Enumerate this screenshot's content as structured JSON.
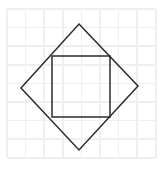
{
  "figure": {
    "background_color": "#ffffff",
    "stroke_color": "#2b2b2b",
    "grid_color": "#efefef",
    "canvas": {
      "width": 161,
      "height": 177
    },
    "grid": {
      "origin_x": 7,
      "origin_y": 9,
      "cell_size": 18.6,
      "columns": 8,
      "rows": 8,
      "visible": true
    },
    "shapes": [
      {
        "name": "rotated-square",
        "type": "polygon",
        "label": "Diamond (square rotated 45 degrees)",
        "points": "79,24 138,86 79,150 21,88"
      },
      {
        "name": "inner-square",
        "type": "polygon",
        "label": "Axis-aligned square",
        "points": "52,56 110,56 110,117 52,117"
      }
    ],
    "vertices": {
      "rotated_square": [
        {
          "name": "top",
          "x": 79,
          "y": 24
        },
        {
          "name": "right",
          "x": 138,
          "y": 86
        },
        {
          "name": "bottom",
          "x": 79,
          "y": 150
        },
        {
          "name": "left",
          "x": 21,
          "y": 88
        }
      ],
      "inner_square": [
        {
          "name": "top-left",
          "x": 52,
          "y": 56
        },
        {
          "name": "top-right",
          "x": 110,
          "y": 56
        },
        {
          "name": "bottom-right",
          "x": 110,
          "y": 117
        },
        {
          "name": "bottom-left",
          "x": 52,
          "y": 117
        }
      ]
    }
  }
}
